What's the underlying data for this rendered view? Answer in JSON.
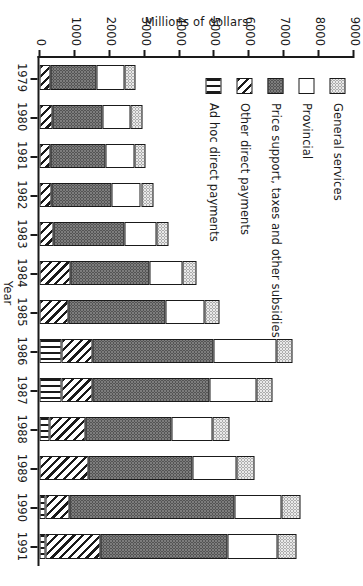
{
  "chart_data": {
    "type": "bar",
    "orientation": "horizontal-stacked-rotated",
    "title": "",
    "xlabel": "Year",
    "ylabel": "Millions of dollars",
    "ylim": [
      0,
      9000
    ],
    "ytick_labels": [
      "0",
      "1000",
      "2000",
      "3000",
      "4000",
      "5000",
      "6000",
      "7000",
      "8000",
      "9000"
    ],
    "ytick_values": [
      0,
      1000,
      2000,
      3000,
      4000,
      5000,
      6000,
      7000,
      8000,
      9000
    ],
    "grid": false,
    "legend_position": "top-left",
    "categories": [
      "1979",
      "1980",
      "1981",
      "1982",
      "1983",
      "1984",
      "1985",
      "1986",
      "1987",
      "1988",
      "1989",
      "1990",
      "1991"
    ],
    "series": [
      {
        "name": "Ad hoc direct payments",
        "pattern": "vertical-lines",
        "values": [
          0,
          0,
          0,
          0,
          0,
          0,
          0,
          620,
          640,
          300,
          0,
          180,
          170
        ]
      },
      {
        "name": "Other direct payments",
        "pattern": "diagonal-hatch",
        "values": [
          330,
          360,
          330,
          340,
          400,
          880,
          820,
          900,
          870,
          1010,
          1400,
          680,
          1570
        ]
      },
      {
        "name": "Price support, taxes and other subsidies",
        "pattern": "dark-stipple",
        "values": [
          1300,
          1460,
          1560,
          1720,
          2050,
          2260,
          2800,
          3480,
          3360,
          2480,
          3000,
          4720,
          3650
        ]
      },
      {
        "name": "Provincial",
        "pattern": "white",
        "values": [
          800,
          790,
          820,
          850,
          900,
          960,
          1100,
          1800,
          1350,
          1160,
          1240,
          1350,
          1420
        ]
      },
      {
        "name": "General services",
        "pattern": "light-stipple",
        "values": [
          330,
          330,
          340,
          350,
          360,
          400,
          440,
          460,
          470,
          490,
          510,
          560,
          560
        ]
      }
    ],
    "totals": [
      2760,
      2940,
      3050,
      3260,
      3710,
      4500,
      5160,
      7260,
      6690,
      5440,
      6150,
      7490,
      7370
    ]
  },
  "legend": {
    "items": [
      {
        "label": "General services",
        "pattern_class": "p-general"
      },
      {
        "label": "Provincial",
        "pattern_class": "p-provincial"
      },
      {
        "label": "Price support, taxes and other subsidies",
        "pattern_class": "p-price"
      },
      {
        "label": "Other direct payments",
        "pattern_class": "p-other"
      },
      {
        "label": "Ad hoc direct payments",
        "pattern_class": "p-adhoc"
      }
    ]
  },
  "colors": {
    "axis": "#1a1a1a",
    "background": "#ffffff",
    "general_services": "#e9e9e9",
    "provincial": "#ffffff",
    "price_support": "#7d7d7d",
    "other_direct": "#ffffff",
    "ad_hoc": "#ffffff"
  }
}
